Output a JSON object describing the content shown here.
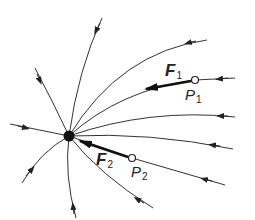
{
  "diagram": {
    "type": "electric-field-lines",
    "colors": {
      "line": "#333333",
      "charge": "#111111",
      "background": "#ffffff"
    },
    "charge": {
      "label": "",
      "sign": "negative"
    },
    "points": [
      {
        "id": "P1",
        "letter": "P",
        "sub": "1"
      },
      {
        "id": "P2",
        "letter": "P",
        "sub": "2"
      }
    ],
    "forces": [
      {
        "id": "F1",
        "letter": "F",
        "sub": "1",
        "at": "P1"
      },
      {
        "id": "F2",
        "letter": "F",
        "sub": "2",
        "at": "P2"
      }
    ]
  }
}
